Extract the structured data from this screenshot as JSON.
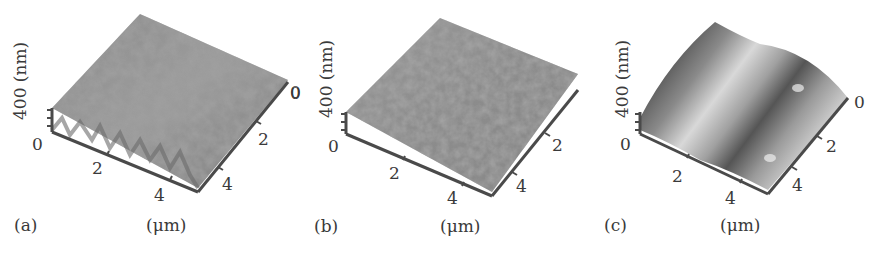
{
  "figure": {
    "panels": [
      {
        "id": "a",
        "label": "(a)",
        "z_axis_label": "400 (nm)",
        "z_zero": "0",
        "x_ticks": [
          "2",
          "4"
        ],
        "y_ticks": [
          "0",
          "2",
          "4"
        ],
        "unit_label": "(μm)",
        "surface": "rough granular"
      },
      {
        "id": "b",
        "label": "(b)",
        "z_axis_label": "400 (nm)",
        "z_zero": "0",
        "x_ticks": [
          "2",
          "4"
        ],
        "y_ticks": [
          "0",
          "2",
          "4"
        ],
        "unit_label": "(μm)",
        "surface": "rough fine-grained"
      },
      {
        "id": "c",
        "label": "(c)",
        "z_axis_label": "400 (nm)",
        "z_zero": "0",
        "x_ticks": [
          "2",
          "4"
        ],
        "y_ticks": [
          "0",
          "2",
          "4"
        ],
        "unit_label": "(μm)",
        "surface": "smooth wavy ridges"
      }
    ]
  },
  "colors": {
    "axis": "#4a4a4a",
    "surface_dark": "#5a5a5a",
    "surface_light": "#d8d8d8",
    "text": "#3a3a3a"
  }
}
